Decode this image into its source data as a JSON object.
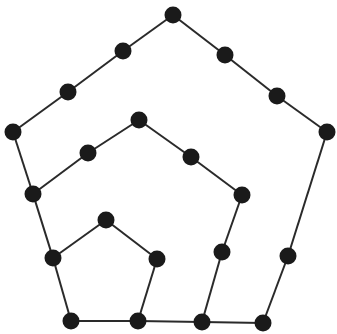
{
  "diagram": {
    "type": "graph",
    "background": "#ffffff",
    "edge_color": "#2a2a2a",
    "node_color": "#1a1a1a",
    "node_radius": 8.5,
    "edge_width": 2,
    "nodes": [
      {
        "id": "n1",
        "x": 173,
        "y": 15
      },
      {
        "id": "n2",
        "x": 123,
        "y": 51
      },
      {
        "id": "n3",
        "x": 68,
        "y": 92
      },
      {
        "id": "n4",
        "x": 13,
        "y": 132
      },
      {
        "id": "n5",
        "x": 225,
        "y": 55
      },
      {
        "id": "n6",
        "x": 277,
        "y": 96
      },
      {
        "id": "n7",
        "x": 327,
        "y": 132
      },
      {
        "id": "n8",
        "x": 33,
        "y": 194
      },
      {
        "id": "n9",
        "x": 139,
        "y": 120
      },
      {
        "id": "n10",
        "x": 88,
        "y": 153
      },
      {
        "id": "n11",
        "x": 191,
        "y": 157
      },
      {
        "id": "n12",
        "x": 242,
        "y": 195
      },
      {
        "id": "n13",
        "x": 222,
        "y": 252
      },
      {
        "id": "n14",
        "x": 288,
        "y": 256
      },
      {
        "id": "n15",
        "x": 106,
        "y": 220
      },
      {
        "id": "n16",
        "x": 53,
        "y": 258
      },
      {
        "id": "n17",
        "x": 157,
        "y": 259
      },
      {
        "id": "n18",
        "x": 71,
        "y": 321
      },
      {
        "id": "n19",
        "x": 138,
        "y": 321
      },
      {
        "id": "n20",
        "x": 202,
        "y": 322
      },
      {
        "id": "n21",
        "x": 263,
        "y": 323
      }
    ],
    "edges": [
      [
        "n4",
        "n3"
      ],
      [
        "n3",
        "n2"
      ],
      [
        "n2",
        "n1"
      ],
      [
        "n1",
        "n5"
      ],
      [
        "n5",
        "n6"
      ],
      [
        "n6",
        "n7"
      ],
      [
        "n7",
        "n14"
      ],
      [
        "n14",
        "n21"
      ],
      [
        "n21",
        "n20"
      ],
      [
        "n4",
        "n8"
      ],
      [
        "n8",
        "n16"
      ],
      [
        "n16",
        "n18"
      ],
      [
        "n18",
        "n19"
      ],
      [
        "n19",
        "n20"
      ],
      [
        "n8",
        "n10"
      ],
      [
        "n10",
        "n9"
      ],
      [
        "n9",
        "n11"
      ],
      [
        "n11",
        "n12"
      ],
      [
        "n12",
        "n13"
      ],
      [
        "n13",
        "n20"
      ],
      [
        "n16",
        "n15"
      ],
      [
        "n15",
        "n17"
      ],
      [
        "n17",
        "n19"
      ]
    ]
  }
}
